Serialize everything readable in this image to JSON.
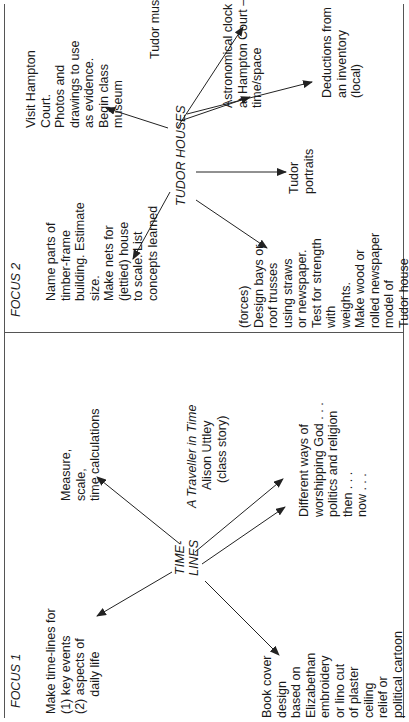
{
  "sections": {
    "focus1": "FOCUS 1",
    "focus2": "FOCUS 2"
  },
  "hubs": {
    "timelines": "TIME-\nLINES",
    "tudor_houses": "TUDOR HOUSES"
  },
  "timelines_nodes": {
    "make_timelines": "Make time-lines for\n(1) key events\n(2) aspects of\n     daily life",
    "measure": "Measure,\nscale,\ntime calculations",
    "traveller_title": "A Traveller in Time",
    "traveller_sub": "Alison Uttley\n  (class story)",
    "worship": "Different ways of\nworshipping God . . .\npolitics and religion\nthen . . .\nnow . . .",
    "book_cover": "Book cover\ndesign\nbased on\nElizabethan\nembroidery\nor lino cut\nof plaster\nceiling\nrelief or\npolitical cartoon"
  },
  "tudor_nodes": {
    "name_parts": "Name parts of\ntimber-frame\nbuilding. Estimate\nsize.\nMake nets for\n(jettied) house\nto scale. List\nconcepts learned",
    "visit": "Visit Hampton\nCourt.\nPhotos and\ndrawings to use\nas evidence.\nBegin class\nmuseum",
    "music": "Tudor music",
    "clock": "Astronomical clock\nat Hampton Court –\ntime/space",
    "deductions": "Deductions from\nan inventory\n(local)",
    "portraits": "Tudor\nportraits",
    "forces": "(forces)\nDesign bays or\nroof trusses\nusing straws\nor newspaper.\nTest for strength\nwith\nweights.\nMake wood or\nrolled newspaper\nmodel of\nTudor house"
  },
  "colors": {
    "line": "#222222",
    "frame": "#555555",
    "text": "#1a1a1a"
  }
}
